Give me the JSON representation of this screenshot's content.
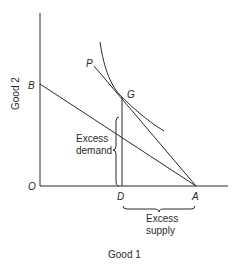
{
  "diagram": {
    "type": "edgeworth-offer-disequilibrium",
    "axes": {
      "x_label": "Good 1",
      "y_label": "Good 2",
      "origin_label": "O"
    },
    "points": {
      "A": "A",
      "B": "B",
      "D": "D",
      "G": "G",
      "P": "P"
    },
    "annotations": {
      "excess_demand_line1": "Excess",
      "excess_demand_line2": "demand",
      "excess_supply_line1": "Excess",
      "excess_supply_line2": "supply"
    },
    "elements": [
      {
        "name": "budget-line-AB",
        "from": "B",
        "to": "A"
      },
      {
        "name": "price-line-PA",
        "from": "P",
        "to": "A",
        "through": "G"
      },
      {
        "name": "indifference-curve",
        "tangent_at": "G"
      },
      {
        "name": "vertical-line-DG",
        "from": "D",
        "to": "G"
      }
    ],
    "colors": {
      "ink": "#2a2a2a",
      "background": "#ffffff"
    }
  }
}
